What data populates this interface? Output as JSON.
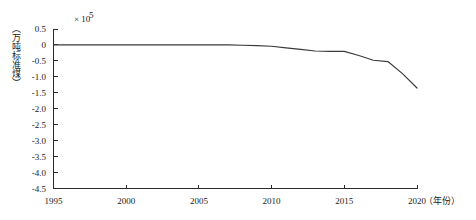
{
  "chart_data": {
    "type": "line",
    "title": "",
    "subtitle": "",
    "xlabel": "（年份）",
    "ylabel": "（万吨标准煤）",
    "y_multiplier": "× 10",
    "y_multiplier_exponent": "5",
    "xlim": [
      1995,
      2020
    ],
    "ylim": [
      -4.5,
      0.5
    ],
    "grid": false,
    "legend": "none",
    "x_tick_labels": [
      "1995",
      "2000",
      "2005",
      "2010",
      "2015",
      "2020"
    ],
    "x_ticks": [
      1995,
      2000,
      2005,
      2010,
      2015,
      2020
    ],
    "y_tick_labels": [
      "0.5",
      "0",
      "-0.5",
      "-1.0",
      "-1.5",
      "-2.0",
      "-2.5",
      "-3.0",
      "-3.5",
      "-4.0",
      "-4.5"
    ],
    "y_ticks": [
      0.5,
      0,
      -0.5,
      -1.0,
      -1.5,
      -2.0,
      -2.5,
      -3.0,
      -3.5,
      -4.0,
      -4.5
    ],
    "series": [
      {
        "name": "累计值",
        "color": "#3a3a3a",
        "x": [
          1995,
          1996,
          1997,
          1998,
          1999,
          2000,
          2001,
          2002,
          2003,
          2004,
          2005,
          2006,
          2007,
          2008,
          2009,
          2010,
          2011,
          2012,
          2013,
          2014,
          2015,
          2016,
          2017,
          2018,
          2019,
          2020
        ],
        "values": [
          0.0,
          0.0,
          0.0,
          0.0,
          0.0,
          0.0,
          0.0,
          0.0,
          0.0,
          0.0,
          0.0,
          0.0,
          0.0,
          -0.01,
          -0.02,
          -0.04,
          -0.09,
          -0.14,
          -0.19,
          -0.2,
          -0.2,
          -0.33,
          -0.48,
          -0.52,
          -0.9,
          -1.35
        ]
      }
    ],
    "annotations": []
  },
  "axis": {
    "multiplier_base": "× 10",
    "multiplier_exp": "5",
    "x_axis_unit": "（年份）",
    "y_axis_unit": "（万吨标准煤）"
  }
}
